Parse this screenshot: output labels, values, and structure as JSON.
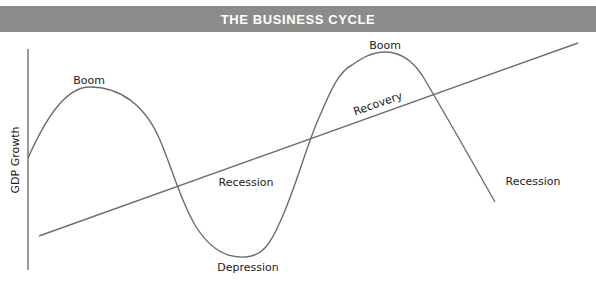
{
  "title": "THE BUSINESS CYCLE",
  "colors": {
    "banner": "#8c8c8c",
    "banner_text": "#ffffff",
    "line": "#6e6e6e",
    "text": "#222222"
  },
  "axis": {
    "y_label": "GDP Growth"
  },
  "labels": {
    "boom_1": "Boom",
    "recession_1": "Recession",
    "depression": "Depression",
    "recovery": "Recovery",
    "boom_2": "Boom",
    "recession_2": "Recession"
  }
}
